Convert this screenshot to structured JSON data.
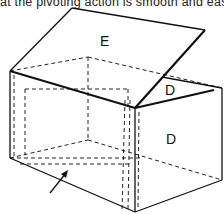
{
  "caption": "at the pivoting action is smooth and eas",
  "diagram": {
    "type": "isometric box with hinged lid",
    "labels": {
      "lid": "E",
      "flap_upper": "D",
      "side_panel": "D"
    },
    "arrow": "pointer to inner base panel",
    "colors": {
      "line": "#111111",
      "background": "#ffffff"
    }
  }
}
